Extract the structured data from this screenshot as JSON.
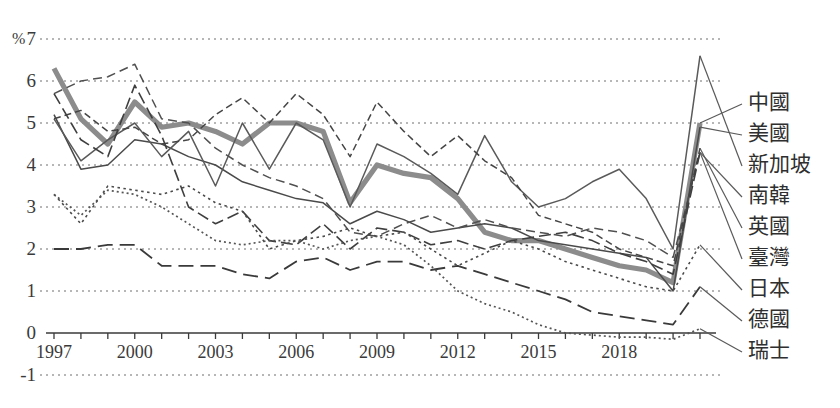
{
  "axes": {
    "unit_label": "%",
    "y_ticks": [
      "7",
      "6",
      "5",
      "4",
      "3",
      "2",
      "1",
      "0",
      "-1"
    ],
    "y_values": [
      7,
      6,
      5,
      4,
      3,
      2,
      1,
      0,
      -1
    ],
    "x_ticks": [
      "1997",
      "2000",
      "2003",
      "2006",
      "2009",
      "2012",
      "2015",
      "2018"
    ],
    "x_tick_years": [
      1997,
      2000,
      2003,
      2006,
      2009,
      2012,
      2015,
      2018
    ]
  },
  "chart_data": {
    "type": "line",
    "title": "",
    "xlabel": "",
    "ylabel": "%",
    "xlim": [
      1997,
      2021
    ],
    "ylim": [
      -1,
      7
    ],
    "grid": true,
    "legend_position": "right",
    "x": [
      1997,
      1998,
      1999,
      2000,
      2001,
      2002,
      2003,
      2004,
      2005,
      2006,
      2007,
      2008,
      2009,
      2010,
      2011,
      2012,
      2013,
      2014,
      2015,
      2016,
      2017,
      2018,
      2019,
      2020,
      2021
    ],
    "series": [
      {
        "name": "中國",
        "color": "#8c8c8c",
        "style": "thick-solid",
        "values": [
          6.3,
          5.1,
          4.5,
          5.5,
          4.9,
          5.0,
          4.8,
          4.5,
          5.0,
          5.0,
          4.8,
          3.1,
          4.0,
          3.8,
          3.7,
          3.2,
          2.4,
          2.2,
          2.2,
          2.0,
          1.8,
          1.6,
          1.5,
          1.2,
          5.0
        ]
      },
      {
        "name": "美國",
        "color": "#4a4a4a",
        "style": "solid",
        "values": [
          5.2,
          3.9,
          4.0,
          4.6,
          4.5,
          4.2,
          4.0,
          3.6,
          3.4,
          3.2,
          3.1,
          2.6,
          2.9,
          2.7,
          2.4,
          2.5,
          2.6,
          2.5,
          2.2,
          2.1,
          2.0,
          1.9,
          1.8,
          1.0,
          4.9
        ]
      },
      {
        "name": "新加坡",
        "color": "#5a5a5a",
        "style": "solid",
        "values": [
          5.1,
          4.1,
          4.6,
          5.0,
          4.2,
          4.8,
          3.5,
          5.0,
          3.9,
          5.0,
          4.6,
          3.0,
          4.5,
          4.2,
          3.8,
          3.3,
          4.7,
          3.6,
          3.0,
          3.2,
          3.6,
          3.9,
          3.2,
          2.0,
          6.6
        ]
      },
      {
        "name": "南韓",
        "color": "#505050",
        "style": "dashed",
        "values": [
          5.7,
          6.0,
          6.1,
          6.4,
          5.1,
          5.0,
          4.4,
          4.0,
          3.7,
          3.5,
          3.2,
          2.4,
          2.3,
          2.6,
          2.8,
          2.5,
          2.7,
          2.5,
          2.4,
          2.3,
          2.5,
          2.4,
          2.2,
          1.8,
          4.3
        ]
      },
      {
        "name": "英國",
        "color": "#454545",
        "style": "dash-dot",
        "values": [
          5.1,
          5.3,
          4.8,
          4.9,
          4.5,
          4.6,
          5.2,
          5.6,
          5.0,
          5.7,
          5.2,
          4.2,
          5.5,
          4.8,
          4.2,
          4.7,
          4.1,
          3.7,
          2.8,
          2.6,
          2.4,
          2.0,
          1.8,
          1.6,
          4.4
        ]
      },
      {
        "name": "臺灣",
        "color": "#3f3f3f",
        "style": "dashed-med",
        "values": [
          5.7,
          4.6,
          4.2,
          5.9,
          4.7,
          3.0,
          2.6,
          2.9,
          2.2,
          2.1,
          2.6,
          2.0,
          2.5,
          2.4,
          2.1,
          2.2,
          2.0,
          2.2,
          2.3,
          2.4,
          2.2,
          1.9,
          1.7,
          1.4,
          4.3
        ]
      },
      {
        "name": "日本",
        "color": "#4a4a4a",
        "style": "dotted",
        "values": [
          3.3,
          2.6,
          3.5,
          3.4,
          3.3,
          3.5,
          3.1,
          2.9,
          2.0,
          2.2,
          2.3,
          2.5,
          2.3,
          2.4,
          2.0,
          1.6,
          1.9,
          2.2,
          2.0,
          1.7,
          1.5,
          1.3,
          1.1,
          1.0,
          2.1
        ]
      },
      {
        "name": "德國",
        "color": "#3a3a3a",
        "style": "long-dash",
        "values": [
          2.0,
          2.0,
          2.1,
          2.1,
          1.6,
          1.6,
          1.6,
          1.4,
          1.3,
          1.7,
          1.8,
          1.5,
          1.7,
          1.7,
          1.5,
          1.6,
          1.4,
          1.2,
          1.0,
          0.8,
          0.5,
          0.4,
          0.3,
          0.2,
          1.1
        ]
      },
      {
        "name": "瑞士",
        "color": "#555555",
        "style": "fine-dotted",
        "values": [
          3.3,
          2.8,
          3.4,
          3.3,
          3.0,
          2.6,
          2.2,
          2.1,
          2.2,
          2.2,
          2.0,
          2.2,
          2.3,
          2.1,
          1.6,
          1.0,
          0.7,
          0.5,
          0.2,
          0.0,
          -0.05,
          -0.1,
          -0.1,
          -0.15,
          0.1
        ]
      }
    ]
  },
  "legend": {
    "items": [
      {
        "label": "中國"
      },
      {
        "label": "美國"
      },
      {
        "label": "新加坡"
      },
      {
        "label": "南韓"
      },
      {
        "label": "英國"
      },
      {
        "label": "臺灣"
      },
      {
        "label": "日本"
      },
      {
        "label": "德國"
      },
      {
        "label": "瑞士"
      }
    ]
  }
}
